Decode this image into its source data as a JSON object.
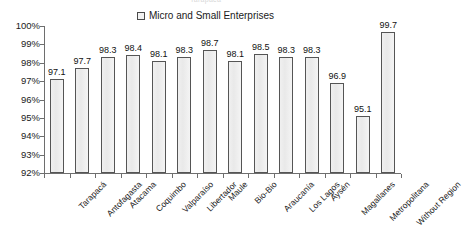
{
  "chart_data": {
    "type": "bar",
    "title": "Tarapacá",
    "subtitle": "",
    "xlabel": "",
    "ylabel": "",
    "ylim": [
      92,
      100
    ],
    "ytick_labels": [
      "100%",
      "99%",
      "98%",
      "97%",
      "96%",
      "95%",
      "94%",
      "93%",
      "92%"
    ],
    "ytick_values": [
      100,
      99,
      98,
      97,
      96,
      95,
      94,
      93,
      92
    ],
    "grid": false,
    "legend_position": "top-center",
    "legend": [
      "Micro and Small Enterprises"
    ],
    "categories": [
      "Tarapacá",
      "Antofagasta",
      "Atacama",
      "Coquimbo",
      "Valparaíso",
      "Libertador",
      "Maule",
      "Bio-Bio",
      "Araucanía",
      "Los Lagos",
      "Aysén",
      "Magallanes",
      "Metropolitana",
      "Without Region"
    ],
    "series": [
      {
        "name": "Micro and Small Enterprises",
        "values": [
          97.1,
          97.7,
          98.3,
          98.4,
          98.1,
          98.3,
          98.7,
          98.1,
          98.5,
          98.3,
          98.3,
          96.9,
          95.1,
          99.7
        ]
      }
    ],
    "value_labels": [
      "97.1",
      "97.7",
      "98.3",
      "98.4",
      "98.1",
      "98.3",
      "98.7",
      "98.1",
      "98.5",
      "98.3",
      "98.3",
      "96.9",
      "95.1",
      "99.7"
    ],
    "colors": {
      "bar_fill": "#eeeeee",
      "bar_border": "#555555",
      "axis": "#6e6e6e",
      "text": "#1a1a1a",
      "background": "#ffffff"
    }
  },
  "legend": {
    "entry_label": "Micro and Small Enterprises"
  }
}
